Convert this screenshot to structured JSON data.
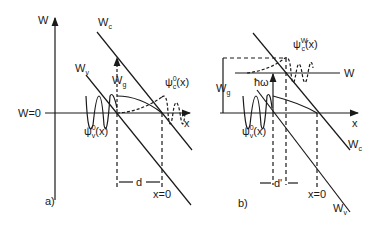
{
  "panel_a": {
    "label": "a)",
    "axis_y": "W",
    "axis_x": "x",
    "zero_level": "W=0",
    "conduction_band": "W",
    "conduction_band_sub": "c",
    "valence_band": "W",
    "valence_band_sub": "v",
    "gap": "W",
    "gap_sub": "g",
    "psi_v": "ψ",
    "psi_v_sub": "v",
    "psi_v_sup": "0",
    "psi_v_arg": "(x)",
    "psi_c": "ψ",
    "psi_c_sub": "c",
    "psi_c_sup": "0",
    "psi_c_arg": "(x)",
    "distance": "d",
    "origin": "x=0"
  },
  "panel_b": {
    "label": "b)",
    "axis_x": "x",
    "energy_level": "W",
    "conduction_band": "W",
    "conduction_band_sub": "c",
    "valence_band": "W",
    "valence_band_sub": "v",
    "gap": "W",
    "gap_sub": "g",
    "photon": "ħω",
    "psi_v": "ψ",
    "psi_v_sub": "v",
    "psi_v_sup": "0",
    "psi_v_arg": "(x)",
    "psi_c": "ψ",
    "psi_c_sub": "c",
    "psi_c_sup": "W",
    "psi_c_arg": "(x)",
    "distance": "d'",
    "origin": "x=0"
  }
}
